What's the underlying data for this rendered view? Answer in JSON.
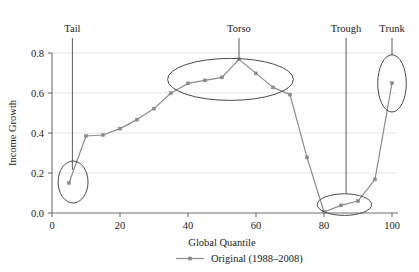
{
  "chart_data": {
    "type": "line",
    "title": "",
    "xlabel": "Global Quantile",
    "ylabel": "Income Growth",
    "xlim": [
      0,
      103
    ],
    "ylim": [
      0.0,
      0.83
    ],
    "grid": true,
    "grid_axis": "y",
    "legend_position": "bottom-center",
    "xticks": [
      0,
      20,
      40,
      60,
      80,
      100
    ],
    "xtick_labels": [
      "0",
      "20",
      "40",
      "60",
      "80",
      "100"
    ],
    "yticks": [
      0.0,
      0.2,
      0.4,
      0.6,
      0.8
    ],
    "ytick_labels": [
      "0.0",
      "0.2",
      "0.4",
      "0.6",
      "0.8"
    ],
    "series": [
      {
        "name": "Original (1988-2008)",
        "color": "#8a8a8a",
        "marker": "square",
        "x": [
          5,
          10,
          15,
          20,
          25,
          30,
          35,
          40,
          45,
          50,
          55,
          60,
          65,
          70,
          75,
          80,
          85,
          90,
          95,
          100
        ],
        "values": [
          0.15,
          0.385,
          0.39,
          0.422,
          0.467,
          0.522,
          0.6,
          0.648,
          0.663,
          0.678,
          0.768,
          0.698,
          0.628,
          0.592,
          0.278,
          0.005,
          0.038,
          0.06,
          0.168,
          0.65
        ]
      }
    ],
    "annotations": [
      {
        "label": "Tail",
        "label_x": 6.0,
        "label_y": 0.905,
        "connector_to_x": 6.0,
        "connector_to_y": 0.215,
        "ellipse_cx": 6.2,
        "ellipse_cy": 0.155,
        "ellipse_rx": 4.4,
        "ellipse_ry": 0.105
      },
      {
        "label": "Torso",
        "label_x": 55.0,
        "label_y": 0.905,
        "connector_to_x": 55.0,
        "connector_to_y": 0.772,
        "ellipse_cx": 52.5,
        "ellipse_cy": 0.668,
        "ellipse_rx": 18.5,
        "ellipse_ry": 0.105
      },
      {
        "label": "Trough",
        "label_x": 86.5,
        "label_y": 0.905,
        "connector_to_x": 86.5,
        "connector_to_y": 0.098,
        "ellipse_cx": 86.0,
        "ellipse_cy": 0.042,
        "ellipse_rx": 8.0,
        "ellipse_ry": 0.054
      },
      {
        "label": "Trunk",
        "label_x": 100.0,
        "label_y": 0.905,
        "connector_to_x": 100.0,
        "connector_to_y": 0.79,
        "ellipse_cx": 100.0,
        "ellipse_cy": 0.648,
        "ellipse_rx": 4.2,
        "ellipse_ry": 0.143
      }
    ]
  },
  "legend": {
    "entries": [
      {
        "label": "Original (1988–2008)",
        "color": "#8a8a8a"
      }
    ]
  },
  "axes": {
    "x_title": "Global Quantile",
    "y_title": "Income Growth"
  },
  "colors": {
    "series_gray": "#8a8a8a",
    "annotation_stroke": "#4a4a4a",
    "axis": "#6e6e6e",
    "grid": "#e8e6e6",
    "text": "#1a1a1a"
  }
}
